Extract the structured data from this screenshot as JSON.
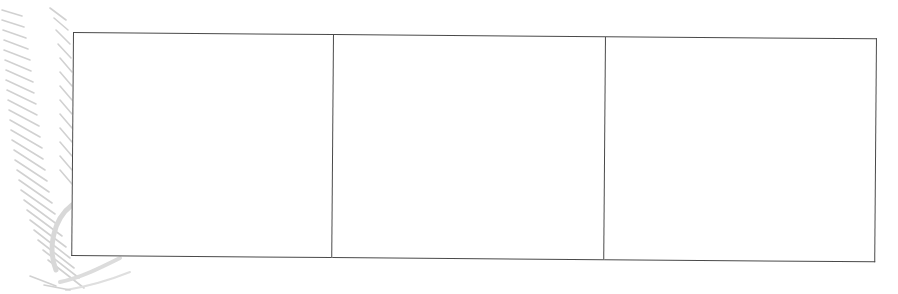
{
  "document": {
    "background_color": "#ffffff",
    "line_color": "#4a4a4a",
    "engraving_color": "#c8c8c8"
  },
  "table": {
    "rows": [
      {
        "cells": [
          {
            "text": ""
          },
          {
            "text": ""
          },
          {
            "text": ""
          }
        ]
      }
    ],
    "column_widths_px": [
      260,
      272,
      271
    ]
  },
  "decoration": {
    "icon": "engraved-scroll-ornament"
  }
}
